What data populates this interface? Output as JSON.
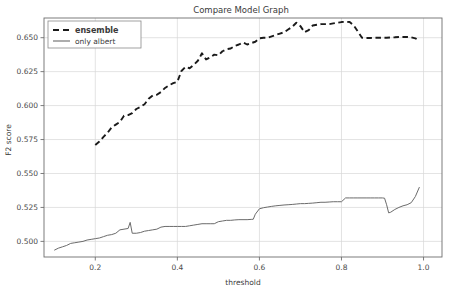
{
  "chart_data": {
    "type": "line",
    "title": "Compare Model Graph",
    "xlabel": "threshold",
    "ylabel": "F2 score",
    "grid": true,
    "legend_position": "upper left",
    "xlim": [
      0.075,
      1.045
    ],
    "ylim": [
      0.4885,
      0.6645
    ],
    "xticks": [
      0.2,
      0.4,
      0.6,
      0.8,
      1.0
    ],
    "xticklabels": [
      "0.2",
      "0.4",
      "0.6",
      "0.8",
      "1.0"
    ],
    "yticks": [
      0.5,
      0.525,
      0.55,
      0.575,
      0.6,
      0.625,
      0.65
    ],
    "yticklabels": [
      "0.500",
      "0.525",
      "0.550",
      "0.575",
      "0.600",
      "0.625",
      "0.650"
    ],
    "series": [
      {
        "name": "ensemble",
        "style": "dashed",
        "color": "#1a1a1a",
        "width": 1.9,
        "x": [
          0.2,
          0.21,
          0.22,
          0.23,
          0.24,
          0.25,
          0.26,
          0.27,
          0.28,
          0.29,
          0.3,
          0.31,
          0.32,
          0.33,
          0.34,
          0.35,
          0.36,
          0.37,
          0.38,
          0.39,
          0.4,
          0.41,
          0.42,
          0.43,
          0.44,
          0.45,
          0.46,
          0.47,
          0.48,
          0.49,
          0.5,
          0.51,
          0.52,
          0.53,
          0.54,
          0.55,
          0.56,
          0.57,
          0.58,
          0.59,
          0.6,
          0.61,
          0.62,
          0.63,
          0.64,
          0.65,
          0.66,
          0.67,
          0.68,
          0.69,
          0.7,
          0.71,
          0.72,
          0.73,
          0.74,
          0.75,
          0.76,
          0.77,
          0.78,
          0.79,
          0.8,
          0.81,
          0.82,
          0.83,
          0.84,
          0.85,
          0.86,
          0.87,
          0.88,
          0.89,
          0.9,
          0.91,
          0.92,
          0.93,
          0.94,
          0.95,
          0.96,
          0.97,
          0.98,
          0.99
        ],
        "y": [
          0.571,
          0.5735,
          0.577,
          0.58,
          0.584,
          0.586,
          0.588,
          0.5925,
          0.593,
          0.5945,
          0.5975,
          0.599,
          0.601,
          0.605,
          0.6075,
          0.608,
          0.61,
          0.613,
          0.615,
          0.6165,
          0.6175,
          0.6255,
          0.6285,
          0.6275,
          0.63,
          0.633,
          0.6385,
          0.634,
          0.6355,
          0.6375,
          0.637,
          0.64,
          0.6415,
          0.642,
          0.644,
          0.645,
          0.6465,
          0.645,
          0.646,
          0.647,
          0.6495,
          0.65,
          0.65,
          0.651,
          0.652,
          0.653,
          0.654,
          0.656,
          0.658,
          0.661,
          0.6585,
          0.654,
          0.6555,
          0.659,
          0.6595,
          0.66,
          0.66,
          0.66,
          0.6605,
          0.661,
          0.6615,
          0.6618,
          0.6615,
          0.659,
          0.6545,
          0.65,
          0.6498,
          0.6498,
          0.65,
          0.65,
          0.65,
          0.65,
          0.6502,
          0.6503,
          0.6505,
          0.6505,
          0.6505,
          0.6503,
          0.6495,
          0.648
        ]
      },
      {
        "name": "only albert",
        "style": "solid",
        "color": "#6b6b6b",
        "width": 1.0,
        "x": [
          0.1,
          0.11,
          0.12,
          0.13,
          0.14,
          0.15,
          0.16,
          0.17,
          0.18,
          0.19,
          0.2,
          0.21,
          0.22,
          0.23,
          0.24,
          0.25,
          0.26,
          0.27,
          0.28,
          0.285,
          0.29,
          0.3,
          0.31,
          0.32,
          0.33,
          0.34,
          0.35,
          0.36,
          0.37,
          0.38,
          0.39,
          0.4,
          0.41,
          0.42,
          0.43,
          0.44,
          0.45,
          0.46,
          0.47,
          0.48,
          0.49,
          0.5,
          0.51,
          0.52,
          0.53,
          0.54,
          0.55,
          0.56,
          0.57,
          0.58,
          0.585,
          0.59,
          0.6,
          0.61,
          0.62,
          0.63,
          0.64,
          0.65,
          0.66,
          0.67,
          0.68,
          0.69,
          0.7,
          0.71,
          0.72,
          0.73,
          0.74,
          0.75,
          0.76,
          0.77,
          0.78,
          0.79,
          0.8,
          0.81,
          0.82,
          0.83,
          0.84,
          0.85,
          0.86,
          0.87,
          0.88,
          0.89,
          0.9,
          0.905,
          0.91,
          0.915,
          0.92,
          0.93,
          0.94,
          0.95,
          0.96,
          0.97,
          0.98,
          0.99
        ],
        "y": [
          0.4935,
          0.495,
          0.496,
          0.497,
          0.4985,
          0.499,
          0.4995,
          0.5,
          0.501,
          0.5015,
          0.502,
          0.5025,
          0.5035,
          0.5045,
          0.505,
          0.506,
          0.5085,
          0.509,
          0.5095,
          0.514,
          0.506,
          0.506,
          0.5065,
          0.5075,
          0.508,
          0.5085,
          0.509,
          0.5105,
          0.511,
          0.511,
          0.511,
          0.511,
          0.511,
          0.511,
          0.5115,
          0.512,
          0.5125,
          0.513,
          0.513,
          0.513,
          0.513,
          0.5145,
          0.515,
          0.5155,
          0.5155,
          0.5158,
          0.516,
          0.516,
          0.516,
          0.5162,
          0.5163,
          0.52,
          0.524,
          0.5248,
          0.5253,
          0.5258,
          0.5262,
          0.5265,
          0.5268,
          0.527,
          0.5272,
          0.5275,
          0.5278,
          0.5278,
          0.528,
          0.5282,
          0.5285,
          0.5288,
          0.5288,
          0.529,
          0.5292,
          0.5292,
          0.5292,
          0.532,
          0.532,
          0.532,
          0.532,
          0.532,
          0.532,
          0.532,
          0.532,
          0.532,
          0.532,
          0.5318,
          0.527,
          0.521,
          0.5215,
          0.5235,
          0.525,
          0.5262,
          0.527,
          0.5285,
          0.533,
          0.54
        ]
      }
    ]
  },
  "legend": {
    "entries": [
      {
        "label": "ensemble",
        "style": "dashed"
      },
      {
        "label": "only albert",
        "style": "solid"
      }
    ]
  },
  "colors": {
    "ensemble": "#1a1a1a",
    "only_albert": "#6b6b6b",
    "grid": "#d7d7d7",
    "spine": "#6e6e6e",
    "background": "#ffffff"
  }
}
